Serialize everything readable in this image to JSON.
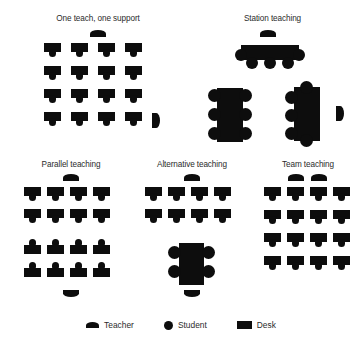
{
  "figure": {
    "type": "diagram",
    "background_color": "#ffffff",
    "ink_color": "#0d0d0d"
  },
  "panels": [
    {
      "id": "one-teach-one-support",
      "title": "One teach, one support",
      "teachers": [
        {
          "position": "top-center",
          "facing": "down"
        },
        {
          "position": "right-side",
          "facing": "right"
        }
      ],
      "student_rows": 4,
      "student_cols": 4,
      "student_count": 16,
      "desk_style": "individual",
      "orientation": "face-down"
    },
    {
      "id": "station-teaching",
      "title": "Station teaching",
      "teachers": [
        {
          "position": "top-center",
          "facing": "down"
        },
        {
          "position": "right-of-right-table",
          "facing": "right"
        }
      ],
      "tables": [
        {
          "id": "top-table",
          "orientation": "horizontal",
          "students_left": 1,
          "students_right": 1,
          "students_bottom": 3,
          "students_top": 0,
          "student_count": 5
        },
        {
          "id": "left-table",
          "orientation": "vertical",
          "students_left": 3,
          "students_right": 3,
          "students_top": 0,
          "students_bottom": 0,
          "student_count": 6
        },
        {
          "id": "right-table",
          "orientation": "vertical",
          "students_left": 3,
          "students_right": 0,
          "students_top": 1,
          "students_bottom": 1,
          "student_count": 5
        }
      ],
      "student_count": 16
    },
    {
      "id": "parallel-teaching",
      "title": "Parallel teaching",
      "teachers": [
        {
          "position": "top-center",
          "facing": "down"
        },
        {
          "position": "bottom-center",
          "facing": "up"
        }
      ],
      "groups": [
        {
          "id": "upper-group",
          "rows": 2,
          "cols": 4,
          "orientation": "face-down",
          "student_count": 8
        },
        {
          "id": "lower-group",
          "rows": 2,
          "cols": 4,
          "orientation": "face-up",
          "student_count": 8
        }
      ],
      "student_count": 16
    },
    {
      "id": "alternative-teaching",
      "title": "Alternative teaching",
      "teachers": [
        {
          "position": "top-center",
          "facing": "down"
        },
        {
          "position": "below-small-group-table",
          "facing": "up"
        }
      ],
      "student_rows": 2,
      "student_cols": 4,
      "student_count": 12,
      "small_group": {
        "id": "alt-table",
        "orientation": "square",
        "students_left": 2,
        "students_right": 2,
        "student_count": 4
      }
    },
    {
      "id": "team-teaching",
      "title": "Team teaching",
      "teachers": [
        {
          "position": "top-center-left",
          "facing": "down"
        },
        {
          "position": "top-center-right",
          "facing": "down"
        }
      ],
      "student_rows": 4,
      "student_cols": 4,
      "student_count": 16,
      "desk_style": "individual",
      "orientation": "face-down"
    }
  ],
  "legend": {
    "items": [
      {
        "icon": "teacher-semicircle-icon",
        "label": "Teacher"
      },
      {
        "icon": "student-circle-icon",
        "label": "Student"
      },
      {
        "icon": "desk-rectangle-icon",
        "label": "Desk"
      }
    ]
  }
}
